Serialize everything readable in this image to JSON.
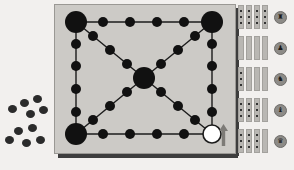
{
  "app": {
    "title": "Board Game",
    "background_color": "#f2f0ee"
  },
  "board": {
    "name": "game-board",
    "background_color": "#cccac6",
    "border_color": "#9a9894",
    "shadow_color": "#3d3d3d",
    "line_color": "#1b1b1b",
    "x": 54,
    "y": 4,
    "width": 180,
    "height": 148,
    "nodes": [
      {
        "id": "corner-top-left",
        "cx": 22,
        "cy": 18,
        "r": 11,
        "fill": "black",
        "size": "large"
      },
      {
        "id": "corner-top-right",
        "cx": 158,
        "cy": 18,
        "r": 11,
        "fill": "black",
        "size": "large"
      },
      {
        "id": "corner-bottom-left",
        "cx": 22,
        "cy": 130,
        "r": 11,
        "fill": "black",
        "size": "large"
      },
      {
        "id": "corner-bottom-right",
        "cx": 158,
        "cy": 130,
        "r": 9,
        "fill": "white",
        "size": "large"
      },
      {
        "id": "center-hub",
        "cx": 90,
        "cy": 74,
        "r": 11,
        "fill": "black",
        "size": "large"
      },
      {
        "id": "top-1",
        "cx": 49,
        "cy": 18,
        "r": 5,
        "fill": "black",
        "size": "medium"
      },
      {
        "id": "top-2",
        "cx": 76,
        "cy": 18,
        "r": 5,
        "fill": "black",
        "size": "medium"
      },
      {
        "id": "top-3",
        "cx": 103,
        "cy": 18,
        "r": 5,
        "fill": "black",
        "size": "medium"
      },
      {
        "id": "top-4",
        "cx": 130,
        "cy": 18,
        "r": 5,
        "fill": "black",
        "size": "medium"
      },
      {
        "id": "bottom-1",
        "cx": 49,
        "cy": 130,
        "r": 5,
        "fill": "black",
        "size": "medium"
      },
      {
        "id": "bottom-2",
        "cx": 76,
        "cy": 130,
        "r": 5,
        "fill": "black",
        "size": "medium"
      },
      {
        "id": "bottom-3",
        "cx": 103,
        "cy": 130,
        "r": 5,
        "fill": "black",
        "size": "medium"
      },
      {
        "id": "bottom-4",
        "cx": 130,
        "cy": 130,
        "r": 5,
        "fill": "black",
        "size": "medium"
      },
      {
        "id": "left-1",
        "cx": 22,
        "cy": 40,
        "r": 5,
        "fill": "black",
        "size": "medium"
      },
      {
        "id": "left-2",
        "cx": 22,
        "cy": 62,
        "r": 5,
        "fill": "black",
        "size": "medium"
      },
      {
        "id": "left-3",
        "cx": 22,
        "cy": 85,
        "r": 5,
        "fill": "black",
        "size": "medium"
      },
      {
        "id": "left-4",
        "cx": 22,
        "cy": 108,
        "r": 5,
        "fill": "black",
        "size": "medium"
      },
      {
        "id": "right-1",
        "cx": 158,
        "cy": 40,
        "r": 5,
        "fill": "black",
        "size": "medium"
      },
      {
        "id": "right-2",
        "cx": 158,
        "cy": 62,
        "r": 5,
        "fill": "black",
        "size": "medium"
      },
      {
        "id": "right-3",
        "cx": 158,
        "cy": 85,
        "r": 5,
        "fill": "black",
        "size": "medium"
      },
      {
        "id": "right-4",
        "cx": 158,
        "cy": 108,
        "r": 5,
        "fill": "black",
        "size": "medium"
      },
      {
        "id": "diag-tl-1",
        "cx": 39,
        "cy": 32,
        "r": 5,
        "fill": "black",
        "size": "medium"
      },
      {
        "id": "diag-tl-2",
        "cx": 56,
        "cy": 46,
        "r": 5,
        "fill": "black",
        "size": "medium"
      },
      {
        "id": "diag-tl-3",
        "cx": 73,
        "cy": 60,
        "r": 5,
        "fill": "black",
        "size": "medium"
      },
      {
        "id": "diag-tr-1",
        "cx": 141,
        "cy": 32,
        "r": 5,
        "fill": "black",
        "size": "medium"
      },
      {
        "id": "diag-tr-2",
        "cx": 124,
        "cy": 46,
        "r": 5,
        "fill": "black",
        "size": "medium"
      },
      {
        "id": "diag-tr-3",
        "cx": 107,
        "cy": 60,
        "r": 5,
        "fill": "black",
        "size": "medium"
      },
      {
        "id": "diag-bl-1",
        "cx": 39,
        "cy": 116,
        "r": 5,
        "fill": "black",
        "size": "medium"
      },
      {
        "id": "diag-bl-2",
        "cx": 56,
        "cy": 102,
        "r": 5,
        "fill": "black",
        "size": "medium"
      },
      {
        "id": "diag-bl-3",
        "cx": 73,
        "cy": 88,
        "r": 5,
        "fill": "black",
        "size": "medium"
      },
      {
        "id": "diag-br-1",
        "cx": 141,
        "cy": 116,
        "r": 5,
        "fill": "black",
        "size": "medium"
      },
      {
        "id": "diag-br-2",
        "cx": 124,
        "cy": 102,
        "r": 5,
        "fill": "black",
        "size": "medium"
      },
      {
        "id": "diag-br-3",
        "cx": 107,
        "cy": 88,
        "r": 5,
        "fill": "black",
        "size": "medium"
      }
    ],
    "edges": [
      {
        "x1": 22,
        "y1": 18,
        "x2": 158,
        "y2": 18
      },
      {
        "x1": 22,
        "y1": 130,
        "x2": 158,
        "y2": 130
      },
      {
        "x1": 22,
        "y1": 18,
        "x2": 22,
        "y2": 130
      },
      {
        "x1": 158,
        "y1": 18,
        "x2": 158,
        "y2": 130
      },
      {
        "x1": 22,
        "y1": 18,
        "x2": 158,
        "y2": 130
      },
      {
        "x1": 158,
        "y1": 18,
        "x2": 22,
        "y2": 130
      }
    ]
  },
  "active_piece": {
    "name": "white-piece",
    "fill": "#ffffff",
    "stroke": "#1b1b1b",
    "position_node": "corner-bottom-right"
  },
  "cursor_arrow": {
    "name": "up-arrow-cursor",
    "color": "#7d7b77",
    "direction": "up"
  },
  "captured_pieces": {
    "name": "captured-pieces-tray",
    "color": "#2b2b2b",
    "groups": [
      {
        "label": "cluster-upper",
        "pieces": [
          {
            "x": 20,
            "y": 99
          },
          {
            "x": 33,
            "y": 95
          },
          {
            "x": 8,
            "y": 105
          },
          {
            "x": 26,
            "y": 110
          },
          {
            "x": 39,
            "y": 106
          }
        ]
      },
      {
        "label": "cluster-lower",
        "pieces": [
          {
            "x": 14,
            "y": 127
          },
          {
            "x": 28,
            "y": 124
          },
          {
            "x": 5,
            "y": 136
          },
          {
            "x": 22,
            "y": 139
          },
          {
            "x": 36,
            "y": 136
          }
        ]
      }
    ]
  },
  "inventory": {
    "name": "inventory-panel",
    "bar_color": "#b9b7b3",
    "bar_border": "#a3a19d",
    "icon_bg": "#8d8b87",
    "rows": [
      {
        "id": "row-1",
        "icon_name": "piece-icon-1",
        "icon_glyph": "♜",
        "bars": [
          {
            "pips": 3
          },
          {
            "pips": 3
          },
          {
            "pips": 3
          },
          {
            "pips": 3
          }
        ]
      },
      {
        "id": "row-2",
        "icon_name": "piece-icon-2",
        "icon_glyph": "♟",
        "bars": [
          {
            "pips": 0
          },
          {
            "pips": 0
          },
          {
            "pips": 0
          },
          {
            "pips": 0
          }
        ]
      },
      {
        "id": "row-3",
        "icon_name": "piece-icon-3",
        "icon_glyph": "♞",
        "bars": [
          {
            "pips": 3
          },
          {
            "pips": 0
          },
          {
            "pips": 0
          },
          {
            "pips": 0
          }
        ]
      },
      {
        "id": "row-4",
        "icon_name": "piece-icon-4",
        "icon_glyph": "♝",
        "bars": [
          {
            "pips": 3
          },
          {
            "pips": 3
          },
          {
            "pips": 3
          },
          {
            "pips": 0
          }
        ]
      },
      {
        "id": "row-5",
        "icon_name": "piece-icon-5",
        "icon_glyph": "♛",
        "bars": [
          {
            "pips": 3
          },
          {
            "pips": 3
          },
          {
            "pips": 3
          },
          {
            "pips": 0
          }
        ]
      }
    ]
  }
}
